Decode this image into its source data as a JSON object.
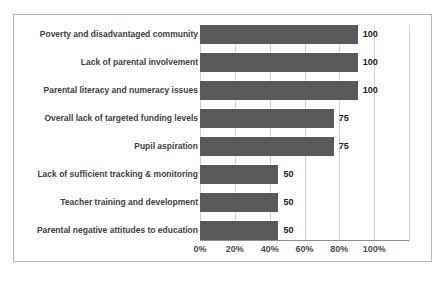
{
  "chart_data": {
    "type": "bar",
    "orientation": "horizontal",
    "title": "",
    "subtitle": "",
    "xlabel": "",
    "ylabel": "",
    "grid": true,
    "legend": false,
    "legend_position": "none",
    "bar_color": "#595959",
    "border_color": "#b9b9b9",
    "gridline_color": "#d2d2d2",
    "axis_color": "#8f8f8f",
    "label_color": "#404040",
    "value_label_color": "#1a1a1a",
    "axis_tick_labels": [
      "0%",
      "20%",
      "40%",
      "60%",
      "80%",
      "100%"
    ],
    "axis_tick_values": [
      0,
      20,
      40,
      60,
      80,
      100
    ],
    "xlim": [
      0,
      120
    ],
    "value_axis_note": "bar value labels are counts; axis is rendered as percent ticks",
    "categories": [
      "Poverty and disadvantaged community",
      "Lack of parental involvement",
      "Parental literacy and numeracy issues",
      "Overall lack of targeted funding levels",
      "Pupil aspiration",
      "Lack of sufficient tracking & monitoring",
      "Teacher training and development",
      "Parental negative attitudes to education"
    ],
    "values": [
      100,
      100,
      100,
      75,
      75,
      50,
      50,
      50
    ],
    "value_labels": [
      "100",
      "100",
      "100",
      "75",
      "75",
      "50",
      "50",
      "50"
    ],
    "bar_pixel_percent": [
      75.5,
      75.5,
      75.5,
      64.0,
      64.0,
      37.5,
      37.5,
      37.5
    ]
  }
}
